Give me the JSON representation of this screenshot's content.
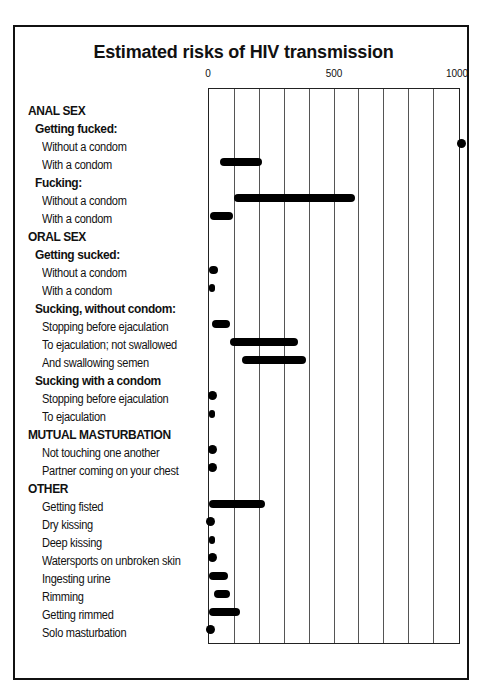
{
  "chart_data": {
    "type": "bar",
    "subtype": "horizontal range (floating) bars",
    "title": "Estimated risks of HIV transmission",
    "xlabel": "",
    "ylabel": "",
    "xlim": [
      0,
      1000
    ],
    "x_ticks": [
      0,
      500,
      1000
    ],
    "grid": {
      "vertical": true,
      "step": 100
    },
    "legend": null,
    "groups": [
      {
        "heading": "ANAL SEX",
        "subgroups": [
          {
            "heading": "Getting fucked:",
            "items": [
              {
                "label": "Without a condom",
                "min": 1000,
                "max": 1000
              },
              {
                "label": "With a condom",
                "min": 45,
                "max": 210
              }
            ]
          },
          {
            "heading": "Fucking:",
            "items": [
              {
                "label": "Without a condom",
                "min": 100,
                "max": 580
              },
              {
                "label": "With a condom",
                "min": 5,
                "max": 95
              }
            ]
          }
        ]
      },
      {
        "heading": "ORAL SEX",
        "subgroups": [
          {
            "heading": "Getting sucked:",
            "items": [
              {
                "label": "Without a condom",
                "min": 0,
                "max": 35
              },
              {
                "label": "With a condom",
                "min": 0,
                "max": 25
              }
            ]
          },
          {
            "heading": "Sucking, without condom:",
            "items": [
              {
                "label": "Stopping before ejaculation",
                "min": 10,
                "max": 85
              },
              {
                "label": "To ejaculation; not swallowed",
                "min": 85,
                "max": 355
              },
              {
                "label": "And swallowing semen",
                "min": 130,
                "max": 385
              }
            ]
          },
          {
            "heading": "Sucking with a condom",
            "items": [
              {
                "label": "Stopping before ejaculation",
                "min": 0,
                "max": 20
              },
              {
                "label": "To ejaculation",
                "min": 0,
                "max": 25
              }
            ]
          }
        ]
      },
      {
        "heading": "MUTUAL MASTURBATION",
        "subgroups": [
          {
            "heading": null,
            "items": [
              {
                "label": "Not touching one another",
                "min": 0,
                "max": 20
              },
              {
                "label": "Partner coming on your chest",
                "min": 0,
                "max": 20
              }
            ]
          }
        ]
      },
      {
        "heading": "OTHER",
        "subgroups": [
          {
            "heading": null,
            "items": [
              {
                "label": "Getting fisted",
                "min": 0,
                "max": 225
              },
              {
                "label": "Dry kissing",
                "min": 0,
                "max": 5
              },
              {
                "label": "Deep kissing",
                "min": 0,
                "max": 25
              },
              {
                "label": "Watersports on unbroken skin",
                "min": 0,
                "max": 20
              },
              {
                "label": "Ingesting urine",
                "min": 0,
                "max": 75
              },
              {
                "label": "Rimming",
                "min": 20,
                "max": 85
              },
              {
                "label": "Getting rimmed",
                "min": 0,
                "max": 125
              },
              {
                "label": "Solo masturbation",
                "min": 0,
                "max": 0
              }
            ]
          }
        ]
      }
    ]
  },
  "rows": [
    {
      "text": "ANAL SEX",
      "level": 0
    },
    {
      "text": "Getting fucked:",
      "level": 1
    },
    {
      "text": "Without a condom",
      "level": 2,
      "min": 1000,
      "max": 1000
    },
    {
      "text": "With a condom",
      "level": 2,
      "min": 45,
      "max": 210
    },
    {
      "text": "Fucking:",
      "level": 1
    },
    {
      "text": "Without a condom",
      "level": 2,
      "min": 100,
      "max": 580
    },
    {
      "text": "With a condom",
      "level": 2,
      "min": 5,
      "max": 95
    },
    {
      "text": "ORAL SEX",
      "level": 0
    },
    {
      "text": "Getting sucked:",
      "level": 1
    },
    {
      "text": "Without a condom",
      "level": 2,
      "min": 0,
      "max": 35
    },
    {
      "text": "With a condom",
      "level": 2,
      "min": 0,
      "max": 25
    },
    {
      "text": "Sucking, without condom:",
      "level": 1
    },
    {
      "text": "Stopping before ejaculation",
      "level": 2,
      "min": 10,
      "max": 85
    },
    {
      "text": "To ejaculation; not swallowed",
      "level": 2,
      "min": 85,
      "max": 355
    },
    {
      "text": "And swallowing semen",
      "level": 2,
      "min": 130,
      "max": 385
    },
    {
      "text": "Sucking with a condom",
      "level": 1
    },
    {
      "text": "Stopping before ejaculation",
      "level": 2,
      "min": 0,
      "max": 20
    },
    {
      "text": "To ejaculation",
      "level": 2,
      "min": 0,
      "max": 25
    },
    {
      "text": "MUTUAL MASTURBATION",
      "level": 0
    },
    {
      "text": "Not touching one another",
      "level": 2,
      "min": 0,
      "max": 20
    },
    {
      "text": "Partner coming on your chest",
      "level": 2,
      "min": 0,
      "max": 20
    },
    {
      "text": "OTHER",
      "level": 0
    },
    {
      "text": "Getting fisted",
      "level": 2,
      "min": 0,
      "max": 225
    },
    {
      "text": "Dry kissing",
      "level": 2,
      "min": 0,
      "max": 5
    },
    {
      "text": "Deep kissing",
      "level": 2,
      "min": 0,
      "max": 25
    },
    {
      "text": "Watersports on unbroken skin",
      "level": 2,
      "min": 0,
      "max": 20
    },
    {
      "text": "Ingesting urine",
      "level": 2,
      "min": 0,
      "max": 75
    },
    {
      "text": "Rimming",
      "level": 2,
      "min": 20,
      "max": 85
    },
    {
      "text": "Getting rimmed",
      "level": 2,
      "min": 0,
      "max": 125
    },
    {
      "text": "Solo masturbation",
      "level": 2,
      "min": 0,
      "max": 0
    }
  ],
  "axis": {
    "tick_0": "0",
    "tick_500": "500",
    "tick_1000": "1000"
  },
  "colors": {
    "ink": "#000000",
    "background": "#ffffff",
    "grid": "#555555"
  }
}
